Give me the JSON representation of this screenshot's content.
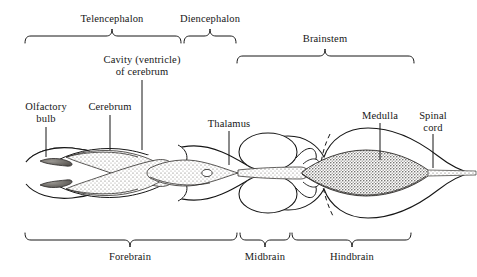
{
  "figure": {
    "orientation": "dorsal view, anterior at left",
    "background_color": "#ffffff",
    "ink_color": "#161616",
    "stipple_color": "#6e6a66"
  },
  "top_brackets": [
    {
      "id": "telencephalon",
      "label": "Telencephalon",
      "x1": 25,
      "x2": 181,
      "tick_x": 112,
      "bracket_y": 36,
      "label_x": 112,
      "label_y": 13
    },
    {
      "id": "diencephalon",
      "label": "Diencephalon",
      "x1": 184,
      "x2": 236,
      "tick_x": 210,
      "bracket_y": 36,
      "label_x": 210,
      "label_y": 13
    },
    {
      "id": "brainstem",
      "label": "Brainstem",
      "x1": 237,
      "x2": 414,
      "tick_x": 325,
      "bracket_y": 56,
      "label_x": 325,
      "label_y": 33
    }
  ],
  "bottom_brackets": [
    {
      "id": "forebrain",
      "label": "Forebrain",
      "x1": 25,
      "x2": 237,
      "tick_x": 130,
      "bracket_y": 240,
      "label_x": 130,
      "label_y": 255
    },
    {
      "id": "midbrain",
      "label": "Midbrain",
      "x1": 240,
      "x2": 290,
      "tick_x": 265,
      "bracket_y": 240,
      "label_x": 265,
      "label_y": 255
    },
    {
      "id": "hindbrain",
      "label": "Hindbrain",
      "x1": 292,
      "x2": 411,
      "tick_x": 352,
      "bracket_y": 240,
      "label_x": 352,
      "label_y": 255
    }
  ],
  "callouts": [
    {
      "id": "cavity-ventricle",
      "label": "Cavity (ventricle)\nof cerebrum",
      "label_x": 142,
      "label_y": 54,
      "align": "center",
      "leader": {
        "x1": 142,
        "y1": 80,
        "x2": 142,
        "y2": 150
      }
    },
    {
      "id": "olfactory-bulb",
      "label": "Olfactory\nbulb",
      "label_x": 46,
      "label_y": 101,
      "align": "center",
      "leader": {
        "x1": 46,
        "y1": 127,
        "x2": 46,
        "y2": 157
      }
    },
    {
      "id": "cerebrum",
      "label": "Cerebrum",
      "label_x": 110,
      "label_y": 101,
      "align": "center",
      "leader": {
        "x1": 110,
        "y1": 115,
        "x2": 110,
        "y2": 150
      }
    },
    {
      "id": "thalamus",
      "label": "Thalamus",
      "label_x": 229,
      "label_y": 118,
      "align": "center",
      "leader": {
        "x1": 229,
        "y1": 131,
        "x2": 229,
        "y2": 165
      }
    },
    {
      "id": "medulla",
      "label": "Medulla",
      "label_x": 380,
      "label_y": 110,
      "align": "center",
      "leader": {
        "x1": 380,
        "y1": 123,
        "x2": 380,
        "y2": 160
      }
    },
    {
      "id": "spinal-cord",
      "label": "Spinal\ncord",
      "label_x": 433,
      "label_y": 110,
      "align": "center",
      "leader": {
        "x1": 433,
        "y1": 134,
        "x2": 433,
        "y2": 168
      }
    }
  ]
}
